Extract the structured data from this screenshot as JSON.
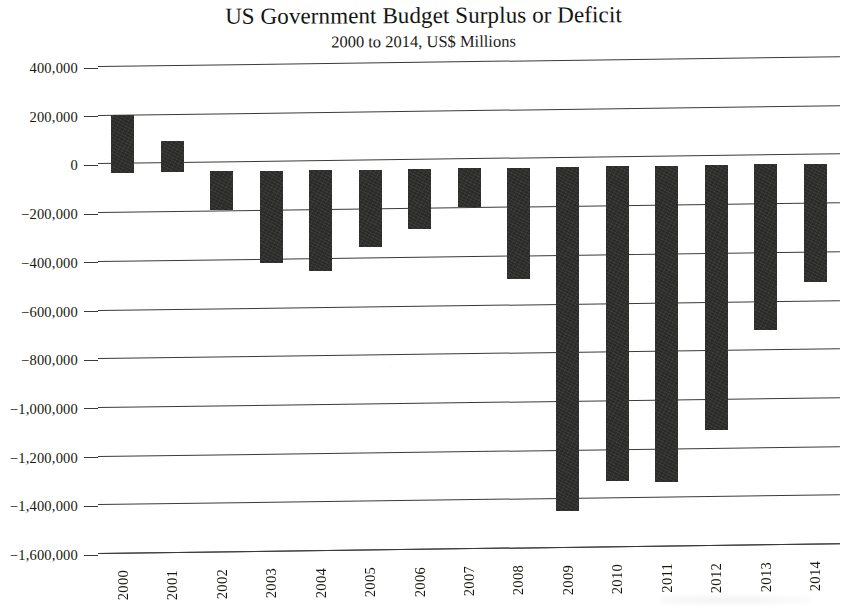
{
  "chart_data": {
    "type": "bar",
    "title": "US Government Budget Surplus or Deficit",
    "subtitle": "2000 to 2014, US$ Millions",
    "xlabel": "",
    "ylabel": "",
    "categories": [
      "2000",
      "2001",
      "2002",
      "2003",
      "2004",
      "2005",
      "2006",
      "2007",
      "2008",
      "2009",
      "2010",
      "2011",
      "2012",
      "2013",
      "2014"
    ],
    "values": [
      236000,
      128000,
      -158000,
      -378000,
      -413000,
      -318000,
      -248000,
      -161000,
      -459000,
      -1413000,
      -1294000,
      -1300000,
      -1087000,
      -680000,
      -485000
    ],
    "ylim": [
      -1600000,
      400000
    ],
    "ytick_values": [
      400000,
      200000,
      0,
      -200000,
      -400000,
      -600000,
      -800000,
      -1000000,
      -1200000,
      -1400000,
      -1600000
    ],
    "ytick_labels": [
      "400,000",
      "200,000",
      "0",
      "−200,000",
      "−400,000",
      "−600,000",
      "−800,000",
      "−1,000,000",
      "−1,200,000",
      "−1,400,000",
      "−1,600,000"
    ],
    "grid": true,
    "legend": null,
    "series_color": "#2b2b29",
    "axis_color": "#3a3a38"
  }
}
